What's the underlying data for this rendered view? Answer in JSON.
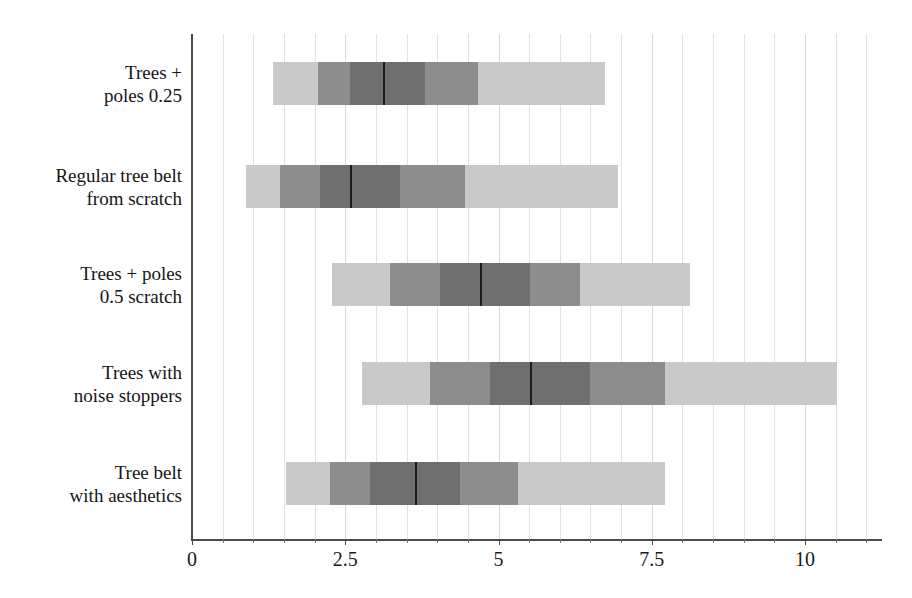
{
  "chart_data": {
    "type": "bar",
    "subtype": "horizontal-box-plot",
    "title": "",
    "xlabel": "",
    "ylabel": "",
    "xlim": [
      0,
      11.25
    ],
    "ylim": null,
    "grid": true,
    "grid_orientation": "vertical",
    "legend": null,
    "xticks": [
      0,
      2.5,
      5,
      7.5,
      10
    ],
    "xticklabels": [
      "0",
      "2.5",
      "5",
      "7.5",
      "10"
    ],
    "minor_tick_step": 0.5,
    "categories": [
      "Trees + poles 0.25",
      "Regular tree belt from scratch",
      "Trees + poles 0.5 scratch",
      "Trees with noise stoppers",
      "Tree belt with aesthetics"
    ],
    "category_labels_wrapped": [
      [
        "Trees +",
        "poles 0.25"
      ],
      [
        "Regular tree belt",
        "from scratch"
      ],
      [
        "Trees + poles",
        "0.5 scratch"
      ],
      [
        "Trees with",
        "noise stoppers"
      ],
      [
        "Tree belt",
        "with aesthetics"
      ]
    ],
    "series": [
      {
        "name": "Trees + poles 0.25",
        "min": 1.32,
        "q1_outer": 2.06,
        "q1": 2.58,
        "median": 3.12,
        "q3": 3.8,
        "q3_outer": 4.67,
        "max": 6.74,
        "segments": [
          {
            "from": 1.32,
            "to": 2.06,
            "shade": "light"
          },
          {
            "from": 2.06,
            "to": 2.58,
            "shade": "medium"
          },
          {
            "from": 2.58,
            "to": 3.8,
            "shade": "dark"
          },
          {
            "from": 3.8,
            "to": 4.67,
            "shade": "medium"
          },
          {
            "from": 4.67,
            "to": 6.74,
            "shade": "light"
          }
        ]
      },
      {
        "name": "Regular tree belt from scratch",
        "min": 0.88,
        "q1_outer": 1.44,
        "q1": 2.09,
        "median": 2.58,
        "q3": 3.39,
        "q3_outer": 4.45,
        "max": 6.95,
        "segments": [
          {
            "from": 0.88,
            "to": 1.44,
            "shade": "light"
          },
          {
            "from": 1.44,
            "to": 2.09,
            "shade": "medium"
          },
          {
            "from": 2.09,
            "to": 3.39,
            "shade": "dark"
          },
          {
            "from": 3.39,
            "to": 4.45,
            "shade": "medium"
          },
          {
            "from": 4.45,
            "to": 6.95,
            "shade": "light"
          }
        ]
      },
      {
        "name": "Trees + poles 0.5 scratch",
        "min": 2.28,
        "q1_outer": 3.23,
        "q1": 4.05,
        "median": 4.7,
        "q3": 5.51,
        "q3_outer": 6.33,
        "max": 8.12,
        "segments": [
          {
            "from": 2.28,
            "to": 3.23,
            "shade": "light"
          },
          {
            "from": 3.23,
            "to": 4.05,
            "shade": "medium"
          },
          {
            "from": 4.05,
            "to": 5.51,
            "shade": "dark"
          },
          {
            "from": 5.51,
            "to": 6.33,
            "shade": "medium"
          },
          {
            "from": 6.33,
            "to": 8.12,
            "shade": "light"
          }
        ]
      },
      {
        "name": "Trees with noise stoppers",
        "min": 2.77,
        "q1_outer": 3.88,
        "q1": 4.86,
        "median": 5.51,
        "q3": 6.49,
        "q3_outer": 7.72,
        "max": 10.52,
        "segments": [
          {
            "from": 2.77,
            "to": 3.88,
            "shade": "light"
          },
          {
            "from": 3.88,
            "to": 4.86,
            "shade": "medium"
          },
          {
            "from": 4.86,
            "to": 6.49,
            "shade": "dark"
          },
          {
            "from": 6.49,
            "to": 7.72,
            "shade": "medium"
          },
          {
            "from": 7.72,
            "to": 10.52,
            "shade": "light"
          }
        ]
      },
      {
        "name": "Tree belt with aesthetics",
        "min": 1.53,
        "q1_outer": 2.25,
        "q1": 2.9,
        "median": 3.64,
        "q3": 4.37,
        "q3_outer": 5.32,
        "max": 7.72,
        "segments": [
          {
            "from": 1.53,
            "to": 2.25,
            "shade": "light"
          },
          {
            "from": 2.25,
            "to": 2.9,
            "shade": "medium"
          },
          {
            "from": 2.9,
            "to": 4.37,
            "shade": "dark"
          },
          {
            "from": 4.37,
            "to": 5.32,
            "shade": "medium"
          },
          {
            "from": 5.32,
            "to": 7.72,
            "shade": "light"
          }
        ]
      }
    ]
  },
  "colors": {
    "light": "#c9c9c9",
    "medium": "#8d8d8d",
    "dark": "#6f6f6f",
    "median_line": "#1c1c1c",
    "axis": "#4a4a4a",
    "gridline": "#e2e2e2",
    "text": "#151515",
    "background": "#ffffff"
  },
  "geometry": {
    "plot_left": 192,
    "plot_top": 34,
    "plot_width": 690,
    "plot_height": 506,
    "px_per_unit": 61.3,
    "bar_height": 43,
    "bar_tops": [
      28,
      131,
      229,
      328,
      428
    ]
  }
}
